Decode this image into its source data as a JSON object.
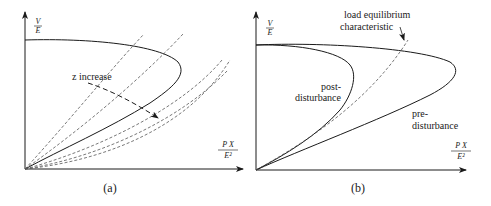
{
  "panels": [
    {
      "id": "a",
      "caption": "(a)",
      "y_axis_label": {
        "num": "V",
        "den": "E"
      },
      "x_axis_label": {
        "num": "P X",
        "den": "E²"
      },
      "annotations": {
        "z_increase": "z increase"
      },
      "curves": {
        "nose_curve": "solid",
        "load_lines": "dashed (5 lines of increasing slope)"
      }
    },
    {
      "id": "b",
      "caption": "(b)",
      "y_axis_label": {
        "num": "V",
        "den": "E"
      },
      "x_axis_label": {
        "num": "P X",
        "den": "E²"
      },
      "annotations": {
        "load_char_line1": "load equilibrium",
        "load_char_line2": "characteristic",
        "post_line1": "post-",
        "post_line2": "disturbance",
        "pre_line1": "pre-",
        "pre_line2": "disturbance"
      }
    }
  ],
  "colors": {
    "ink": "#1a1a1a",
    "dashed": "#555555",
    "background": "#ffffff"
  }
}
